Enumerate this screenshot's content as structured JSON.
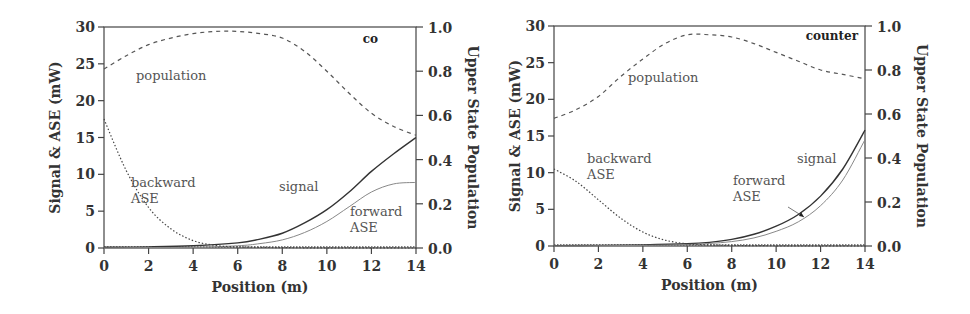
{
  "chart_data": [
    {
      "type": "line",
      "tag": "co",
      "xlabel": "Position (m)",
      "ylabel": "Signal & ASE (mW)",
      "y2label": "Upper State Population",
      "xlim": [
        0,
        14
      ],
      "ylim": [
        0,
        30
      ],
      "y2lim": [
        0,
        1.0
      ],
      "xticks": [
        "0",
        "2",
        "4",
        "6",
        "8",
        "10",
        "12",
        "14"
      ],
      "yticks": [
        "0",
        "5",
        "10",
        "15",
        "20",
        "25",
        "30"
      ],
      "y2ticks": [
        "0.0",
        "0.2",
        "0.4",
        "0.6",
        "0.8",
        "1.0"
      ],
      "grid": false,
      "annotations": [
        "population",
        "backward ASE",
        "signal",
        "forward ASE"
      ],
      "series": [
        {
          "name": "signal",
          "axis": "left",
          "style": "solid",
          "x": [
            0,
            2,
            4,
            6,
            7,
            8,
            9,
            10,
            11,
            12,
            13,
            14
          ],
          "values": [
            0.1,
            0.15,
            0.3,
            0.7,
            1.2,
            2.0,
            3.4,
            5.2,
            7.6,
            10.4,
            12.8,
            15.0
          ]
        },
        {
          "name": "forward ASE",
          "axis": "left",
          "style": "thin",
          "x": [
            0,
            2,
            4,
            6,
            7,
            8,
            9,
            10,
            11,
            12,
            13,
            14
          ],
          "values": [
            0.0,
            0.05,
            0.1,
            0.3,
            0.6,
            1.1,
            2.1,
            3.6,
            5.6,
            7.6,
            8.7,
            8.9
          ]
        },
        {
          "name": "backward ASE",
          "axis": "left",
          "style": "dotted",
          "x": [
            0,
            1,
            2,
            3,
            4,
            5,
            6,
            8,
            10,
            12,
            14
          ],
          "values": [
            17.5,
            10.5,
            5.5,
            2.6,
            1.0,
            0.35,
            0.15,
            0.05,
            0.02,
            0.01,
            0.0
          ]
        },
        {
          "name": "population",
          "axis": "right",
          "style": "dashed",
          "x": [
            0,
            1,
            2,
            3,
            4,
            5,
            6,
            7,
            8,
            9,
            10,
            11,
            12,
            13,
            14
          ],
          "values": [
            0.81,
            0.87,
            0.92,
            0.95,
            0.97,
            0.98,
            0.98,
            0.97,
            0.95,
            0.89,
            0.8,
            0.7,
            0.61,
            0.55,
            0.51
          ]
        }
      ]
    },
    {
      "type": "line",
      "tag": "counter",
      "xlabel": "Position (m)",
      "ylabel": "Signal & ASE (mW)",
      "y2label": "Upper State Population",
      "xlim": [
        0,
        14
      ],
      "ylim": [
        0,
        30
      ],
      "y2lim": [
        0,
        1.0
      ],
      "xticks": [
        "0",
        "2",
        "4",
        "6",
        "8",
        "10",
        "12",
        "14"
      ],
      "yticks": [
        "0",
        "5",
        "10",
        "15",
        "20",
        "25",
        "30"
      ],
      "y2ticks": [
        "0.0",
        "0.2",
        "0.4",
        "0.6",
        "0.8",
        "1.0"
      ],
      "grid": false,
      "annotations": [
        "population",
        "backward ASE",
        "signal",
        "forward ASE"
      ],
      "series": [
        {
          "name": "signal",
          "axis": "left",
          "style": "solid",
          "x": [
            0,
            2,
            4,
            6,
            7,
            8,
            9,
            10,
            11,
            12,
            13,
            14
          ],
          "values": [
            0.05,
            0.08,
            0.15,
            0.3,
            0.5,
            0.9,
            1.6,
            2.7,
            4.3,
            6.8,
            10.5,
            15.8
          ]
        },
        {
          "name": "forward ASE",
          "axis": "left",
          "style": "thin",
          "x": [
            0,
            2,
            4,
            6,
            7,
            8,
            9,
            10,
            11,
            12,
            13,
            14
          ],
          "values": [
            0.0,
            0.03,
            0.08,
            0.2,
            0.35,
            0.6,
            1.1,
            2.0,
            3.3,
            5.5,
            9.0,
            14.5
          ]
        },
        {
          "name": "backward ASE",
          "axis": "left",
          "style": "dotted",
          "x": [
            0,
            1,
            2,
            3,
            4,
            5,
            6,
            7,
            8,
            10,
            12,
            14
          ],
          "values": [
            10.5,
            8.8,
            6.3,
            3.8,
            1.9,
            0.8,
            0.3,
            0.15,
            0.08,
            0.03,
            0.01,
            0.0
          ]
        },
        {
          "name": "population",
          "axis": "right",
          "style": "dashed",
          "x": [
            0,
            1,
            2,
            3,
            4,
            5,
            6,
            7,
            8,
            9,
            10,
            11,
            12,
            13,
            14
          ],
          "values": [
            0.58,
            0.62,
            0.68,
            0.77,
            0.85,
            0.92,
            0.96,
            0.96,
            0.95,
            0.92,
            0.88,
            0.84,
            0.8,
            0.78,
            0.76
          ]
        }
      ]
    }
  ]
}
